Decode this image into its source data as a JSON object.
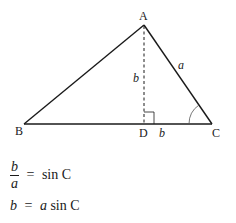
{
  "diagram": {
    "vertices": {
      "A": {
        "label": "A",
        "x": 144,
        "y": 25
      },
      "B": {
        "label": "B",
        "x": 24,
        "y": 124
      },
      "C": {
        "label": "C",
        "x": 212,
        "y": 124
      },
      "D": {
        "label": "D",
        "x": 144,
        "y": 124
      }
    },
    "side_labels": {
      "a": "a",
      "b_height": "b",
      "b_base": "b"
    },
    "colors": {
      "stroke": "#1a1a1a",
      "background": "#ffffff"
    }
  },
  "equations": {
    "eq1": {
      "numerator": "b",
      "denominator": "a",
      "equals": "=",
      "rhs": "sin C"
    },
    "eq2": {
      "lhs": "b",
      "equals": "=",
      "rhs_var": "a",
      "rhs_func": "sin C"
    }
  }
}
